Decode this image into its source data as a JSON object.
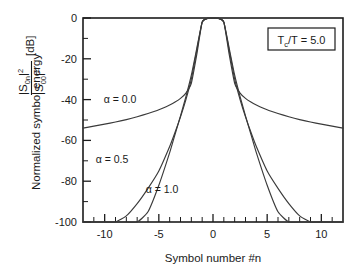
{
  "figure": {
    "name": "normalized-symbol-energy-plot",
    "background_color": "#ffffff",
    "axis_color": "#1c1c1c",
    "curve_color": "#3a3a3a"
  },
  "annotation": {
    "box_label_main": "T",
    "box_label_sub": "c",
    "box_label_rest": "/T = 5.0",
    "box_label_full": "Tc/T = 5.0"
  },
  "ylabel": {
    "prefix": "Normalized symbol energy",
    "numerator_base": "|S",
    "numerator_sub": "0n",
    "numerator_sup": "|2",
    "denominator_base": "|S",
    "denominator_sub": "00",
    "denominator_sup": "|2",
    "unit": "[dB]"
  },
  "xlabel": {
    "text": "Symbol number #n"
  },
  "curve_labels": [
    {
      "name": "alpha-0-0",
      "text": "α = 0.0",
      "x": 120,
      "y": 100
    },
    {
      "name": "alpha-0-5",
      "text": "α = 0.5",
      "x": 112,
      "y": 160
    },
    {
      "name": "alpha-1-0",
      "text": "α = 1.0",
      "x": 160,
      "y": 190
    }
  ],
  "chart_data": {
    "type": "line",
    "title": "",
    "subtitle": "",
    "xlabel": "Symbol number #n",
    "ylabel": "Normalized symbol energy |S0n|^2/|S00|^2 [dB]",
    "xlim": [
      -12,
      12
    ],
    "ylim": [
      -100,
      0
    ],
    "xticks": [
      -10,
      -5,
      0,
      5,
      10
    ],
    "xtick_labels": [
      "-10",
      "-5",
      "0",
      "5",
      "10"
    ],
    "xticks_minor_step": 1,
    "yticks": [
      0,
      -20,
      -40,
      -60,
      -80,
      -100
    ],
    "ytick_labels": [
      "0",
      "-20",
      "-40",
      "-60",
      "-80",
      "-100"
    ],
    "yticks_minor_step": 10,
    "grid": false,
    "legend_position": "inline-annotations",
    "annotations": [
      {
        "text": "Tc/T = 5.0",
        "x": 8.2,
        "y": -6,
        "boxed": true
      }
    ],
    "x": [
      -12,
      -11,
      -10,
      -9,
      -8,
      -7,
      -6,
      -5,
      -4,
      -3.5,
      -3,
      -2.5,
      -2,
      -1.5,
      -1,
      -0.5,
      0,
      0.5,
      1,
      1.5,
      2,
      2.5,
      3,
      3.5,
      4,
      5,
      6,
      7,
      8,
      9,
      10,
      11,
      12
    ],
    "series": [
      {
        "name": "α = 0.0",
        "values": [
          -54.0,
          -53.0,
          -52.0,
          -51.0,
          -49.8,
          -48.4,
          -46.8,
          -45.0,
          -42.6,
          -41.2,
          -39.4,
          -36.8,
          -32.0,
          -18.0,
          -2.0,
          -0.2,
          0.0,
          -0.2,
          -2.0,
          -18.0,
          -32.0,
          -36.8,
          -39.4,
          -41.2,
          -42.6,
          -45.0,
          -46.8,
          -48.4,
          -49.8,
          -51.0,
          -52.0,
          -53.0,
          -54.0
        ]
      },
      {
        "name": "α = 0.5",
        "values": [
          -100,
          -100,
          -100,
          -100,
          -97.0,
          -91.0,
          -83.5,
          -75.0,
          -63.0,
          -56.0,
          -48.5,
          -40.0,
          -30.0,
          -16.0,
          -2.0,
          -0.2,
          0.0,
          -0.2,
          -2.0,
          -16.0,
          -30.0,
          -40.0,
          -48.5,
          -56.0,
          -63.0,
          -75.0,
          -83.5,
          -91.0,
          -97.0,
          -100,
          -100,
          -100,
          -100
        ]
      },
      {
        "name": "α = 1.0",
        "values": [
          -100,
          -100,
          -100,
          -100,
          -100,
          -100,
          -95.0,
          -82.0,
          -66.0,
          -57.0,
          -48.0,
          -38.5,
          -28.0,
          -15.0,
          -2.0,
          -0.2,
          0.0,
          -0.2,
          -2.0,
          -15.0,
          -28.0,
          -38.5,
          -48.0,
          -57.0,
          -66.0,
          -82.0,
          -95.0,
          -100,
          -100,
          -100,
          -100,
          -100,
          -100
        ]
      }
    ]
  }
}
